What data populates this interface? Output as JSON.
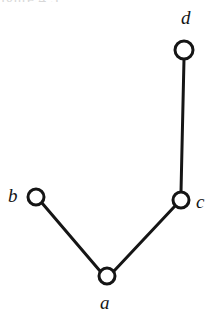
{
  "figure": {
    "caption_remnant": "igure 4.3",
    "background_color": "#ffffff",
    "stroke_color": "#151515",
    "node_fill_color": "#ffffff",
    "width": 214,
    "height": 321
  },
  "graph": {
    "type": "undirected-graph",
    "node_count": 4,
    "edge_count": 3,
    "nodes": [
      {
        "id": "d",
        "label": "d",
        "cx": 184,
        "cy": 50,
        "r": 9,
        "label_x": 181,
        "label_y": 8,
        "label_position": "above"
      },
      {
        "id": "c",
        "label": "c",
        "cx": 181,
        "cy": 200,
        "r": 8,
        "label_x": 196,
        "label_y": 192,
        "label_position": "right"
      },
      {
        "id": "b",
        "label": "b",
        "cx": 36,
        "cy": 197,
        "r": 8,
        "label_x": 8,
        "label_y": 186,
        "label_position": "left"
      },
      {
        "id": "a",
        "label": "a",
        "cx": 107,
        "cy": 276,
        "r": 8,
        "label_x": 100,
        "label_y": 293,
        "label_position": "below"
      }
    ],
    "edges": [
      {
        "id": "edge-d-c",
        "from": "d",
        "to": "c",
        "x1": 184,
        "y1": 59,
        "x2": 181,
        "y2": 192
      },
      {
        "id": "edge-c-a",
        "from": "c",
        "to": "a",
        "x1": 175,
        "y1": 206,
        "x2": 114,
        "y2": 271
      },
      {
        "id": "edge-a-b",
        "from": "a",
        "to": "b",
        "x1": 100,
        "y1": 271,
        "x2": 42,
        "y2": 203
      }
    ],
    "stroke_width_edge": 3,
    "stroke_width_node": 3
  }
}
